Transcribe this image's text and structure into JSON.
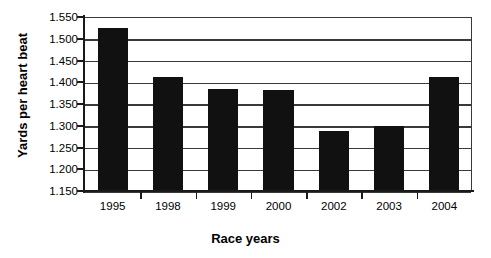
{
  "chart_data": {
    "type": "bar",
    "title": "",
    "xlabel": "Race years",
    "ylabel": "Yards per heart beat",
    "categories": [
      "1995",
      "1998",
      "1999",
      "2000",
      "2002",
      "2003",
      "2004"
    ],
    "values": [
      1.525,
      1.413,
      1.385,
      1.382,
      1.287,
      1.3,
      1.413
    ],
    "ylim": [
      1.15,
      1.55
    ],
    "ytick_labels": [
      "1.550",
      "1.500",
      "1.450",
      "1.400",
      "1.350",
      "1.300",
      "1.250",
      "1.200",
      "1.150"
    ],
    "ytick_values": [
      1.55,
      1.5,
      1.45,
      1.4,
      1.35,
      1.3,
      1.25,
      1.2,
      1.15
    ],
    "grid": true,
    "legend": "none",
    "series": [
      {
        "name": "Yards per heart beat",
        "color": "#111111",
        "values": [
          1.525,
          1.413,
          1.385,
          1.382,
          1.287,
          1.3,
          1.413
        ]
      }
    ],
    "colors": {
      "bar": "#111111",
      "axis": "#1a1a1a",
      "gridline": "#3a3a3a",
      "background": "#ffffff",
      "text": "#000000"
    }
  }
}
